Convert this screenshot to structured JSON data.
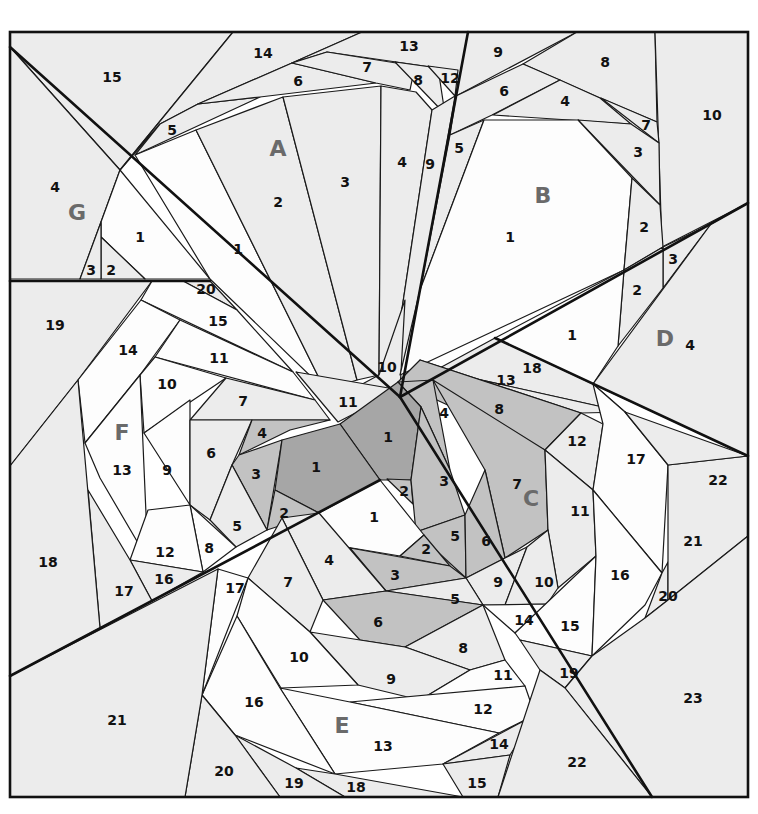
{
  "diagram": {
    "frame": {
      "x": 10,
      "y": 32,
      "width": 738,
      "height": 765
    },
    "colors": {
      "white": "#fdfdfd",
      "light": "#ececec",
      "mid": "#dcdcdc",
      "medium": "#c2c2c2",
      "dark": "#a6a6a6",
      "line": "#111111",
      "section_label": "#6a6a6a"
    },
    "sections": [
      {
        "id": "A",
        "label": "A",
        "x": 278,
        "y": 148
      },
      {
        "id": "B",
        "label": "B",
        "x": 543,
        "y": 195
      },
      {
        "id": "C",
        "label": "C",
        "x": 531,
        "y": 498
      },
      {
        "id": "D",
        "label": "D",
        "x": 665,
        "y": 338
      },
      {
        "id": "E",
        "label": "E",
        "x": 342,
        "y": 725
      },
      {
        "id": "F",
        "label": "F",
        "x": 122,
        "y": 432
      },
      {
        "id": "G",
        "label": "G",
        "x": 77,
        "y": 212
      }
    ],
    "pieces": [
      {
        "section": "G",
        "n": "15",
        "x": 112,
        "y": 77,
        "fill": "light",
        "points": "10,32 233,32 120,170 10,47"
      },
      {
        "section": "G",
        "n": "4",
        "x": 55,
        "y": 187,
        "fill": "light",
        "points": "10,47 120,170 101,222 80,279 10,279"
      },
      {
        "section": "G",
        "n": "1",
        "x": 140,
        "y": 237,
        "fill": "white",
        "points": "120,170 210,279 145,279 101,237 101,222"
      },
      {
        "section": "G",
        "n": "2",
        "x": 111,
        "y": 270,
        "fill": "light",
        "points": "101,237 145,279 101,279"
      },
      {
        "section": "G",
        "n": "3",
        "x": 91,
        "y": 270,
        "fill": "light",
        "points": "101,222 101,279 80,279"
      },
      {
        "section": "A",
        "n": "14",
        "x": 263,
        "y": 53,
        "fill": "light",
        "points": "233,32 362,32 292,63 198,104 160,124 120,170"
      },
      {
        "section": "A",
        "n": "13",
        "x": 409,
        "y": 46,
        "fill": "light",
        "points": "362,32 468,32 458,98 438,68 327,52 292,63"
      },
      {
        "section": "A",
        "n": "5",
        "x": 172,
        "y": 130,
        "fill": "light",
        "points": "160,124 198,104 260,97 135,155"
      },
      {
        "section": "A",
        "n": "6",
        "x": 298,
        "y": 81,
        "fill": "light",
        "points": "198,104 292,63 376,83 260,97"
      },
      {
        "section": "A",
        "n": "7",
        "x": 367,
        "y": 67,
        "fill": "light",
        "points": "292,63 327,52 415,66 410,90 376,83"
      },
      {
        "section": "A",
        "n": "8",
        "x": 418,
        "y": 80,
        "fill": "light",
        "points": "395,62 438,68 445,114"
      },
      {
        "section": "A",
        "n": "12",
        "x": 450,
        "y": 78,
        "fill": "light",
        "points": "428,66 458,70 455,96"
      },
      {
        "section": "A",
        "n": "1",
        "x": 238,
        "y": 249,
        "fill": "white",
        "points": "135,155 196,130 325,390 210,279"
      },
      {
        "section": "A",
        "n": "2",
        "x": 278,
        "y": 202,
        "fill": "light",
        "points": "196,130 283,97 357,380 325,390"
      },
      {
        "section": "A",
        "n": "3",
        "x": 345,
        "y": 182,
        "fill": "light",
        "points": "283,97 381,86 379,375 357,380"
      },
      {
        "section": "A",
        "n": "4",
        "x": 402,
        "y": 162,
        "fill": "light",
        "points": "381,86 416,92 432,110 392,375 379,375"
      },
      {
        "section": "A",
        "n": "9",
        "x": 430,
        "y": 164,
        "fill": "light",
        "points": "432,110 455,96 405,385 392,375"
      },
      {
        "section": "A",
        "n": "10",
        "x": 387,
        "y": 367,
        "fill": "light",
        "points": "379,375 405,300 400,390 355,388"
      },
      {
        "section": "A",
        "n": "11",
        "x": 348,
        "y": 402,
        "fill": "light",
        "points": "296,372 400,390 338,422"
      },
      {
        "section": "B",
        "n": "9",
        "x": 498,
        "y": 52,
        "fill": "light",
        "points": "468,32 577,32 456,96"
      },
      {
        "section": "B",
        "n": "8",
        "x": 605,
        "y": 62,
        "fill": "light",
        "points": "577,32 655,32 657,122 600,98 523,64"
      },
      {
        "section": "B",
        "n": "10",
        "x": 712,
        "y": 115,
        "fill": "light",
        "points": "655,32 748,32 748,203 662,247"
      },
      {
        "section": "B",
        "n": "6",
        "x": 504,
        "y": 91,
        "fill": "light",
        "points": "523,64 560,80 492,115 450,135 456,96"
      },
      {
        "section": "B",
        "n": "4",
        "x": 565,
        "y": 101,
        "fill": "light",
        "points": "560,80 600,98 631,124 493,115"
      },
      {
        "section": "B",
        "n": "7",
        "x": 646,
        "y": 125,
        "fill": "light",
        "points": "601,98 657,122 659,143"
      },
      {
        "section": "B",
        "n": "3",
        "x": 638,
        "y": 152,
        "fill": "light",
        "points": "578,120 631,124 659,143 660,205"
      },
      {
        "section": "B",
        "n": "5",
        "x": 459,
        "y": 148,
        "fill": "light",
        "points": "450,135 484,120 420,290"
      },
      {
        "section": "B",
        "n": "1",
        "x": 510,
        "y": 237,
        "fill": "white",
        "points": "484,120 578,120 632,178 624,270 400,375 420,290"
      },
      {
        "section": "B",
        "n": "2",
        "x": 644,
        "y": 227,
        "fill": "light",
        "points": "632,178 660,205 663,247 624,270"
      },
      {
        "section": "D",
        "n": "3",
        "x": 673,
        "y": 259,
        "fill": "light",
        "points": "663,247 711,224 663,288"
      },
      {
        "section": "D",
        "n": "2",
        "x": 637,
        "y": 290,
        "fill": "light",
        "points": "624,270 663,247 663,288 618,346"
      },
      {
        "section": "D",
        "n": "1",
        "x": 572,
        "y": 335,
        "fill": "white",
        "points": "495,338 624,270 618,346 593,384"
      },
      {
        "section": "D",
        "n": "4",
        "x": 690,
        "y": 345,
        "fill": "light",
        "points": "748,203 748,456 593,384 711,224"
      },
      {
        "section": "C",
        "n": "18",
        "x": 532,
        "y": 368,
        "fill": "light",
        "points": "436,370 495,338 593,384 625,412"
      },
      {
        "section": "C",
        "n": "13",
        "x": 506,
        "y": 380,
        "fill": "light",
        "points": "420,360 436,370 625,412 581,413"
      },
      {
        "section": "C",
        "n": "8",
        "x": 499,
        "y": 409,
        "fill": "medium",
        "points": "398,382 420,360 581,413 545,450"
      },
      {
        "section": "C",
        "n": "4",
        "x": 444,
        "y": 413,
        "fill": "medium",
        "points": "398,382 433,380 450,470 421,407"
      },
      {
        "section": "C",
        "n": "1",
        "x": 388,
        "y": 437,
        "fill": "dark",
        "points": "340,424 398,382 421,407 411,480 380,480"
      },
      {
        "section": "C",
        "n": "2",
        "x": 404,
        "y": 491,
        "fill": "medium",
        "points": "387,479 411,480 413,504"
      },
      {
        "section": "C",
        "n": "3",
        "x": 444,
        "y": 481,
        "fill": "medium",
        "points": "421,407 450,470 465,515 416,532 411,480"
      },
      {
        "section": "C",
        "n": "7",
        "x": 517,
        "y": 484,
        "fill": "medium",
        "points": "433,380 545,450 548,530 505,558 485,470"
      },
      {
        "section": "C",
        "n": "5",
        "x": 455,
        "y": 536,
        "fill": "medium",
        "points": "416,532 465,515 466,578"
      },
      {
        "section": "C",
        "n": "6",
        "x": 486,
        "y": 541,
        "fill": "medium",
        "points": "465,515 485,470 505,558 466,578"
      },
      {
        "section": "C",
        "n": "12",
        "x": 577,
        "y": 441,
        "fill": "light",
        "points": "545,450 581,413 603,424 593,490"
      },
      {
        "section": "C",
        "n": "11",
        "x": 580,
        "y": 511,
        "fill": "light",
        "points": "548,530 545,450 593,490 596,556 558,588"
      },
      {
        "section": "C",
        "n": "9",
        "x": 498,
        "y": 582,
        "fill": "light",
        "points": "466,578 505,558 527,547 505,605 483,605"
      },
      {
        "section": "C",
        "n": "10",
        "x": 544,
        "y": 582,
        "fill": "light",
        "points": "527,547 548,530 558,588 547,604 505,605"
      },
      {
        "section": "C",
        "n": "17",
        "x": 636,
        "y": 459,
        "fill": "white",
        "points": "593,384 625,412 668,465 662,573 593,490 603,424"
      },
      {
        "section": "C",
        "n": "14",
        "x": 524,
        "y": 620,
        "fill": "white",
        "points": "483,605 547,604 515,633"
      },
      {
        "section": "C",
        "n": "15",
        "x": 570,
        "y": 626,
        "fill": "white",
        "points": "515,633 596,556 592,656 520,640"
      },
      {
        "section": "C",
        "n": "16",
        "x": 620,
        "y": 575,
        "fill": "white",
        "points": "596,556 593,490 662,573 645,605 592,656"
      },
      {
        "section": "C",
        "n": "20",
        "x": 668,
        "y": 596,
        "fill": "light",
        "points": "662,573 668,562 668,600 645,618"
      },
      {
        "section": "C",
        "n": "21",
        "x": 693,
        "y": 541,
        "fill": "light",
        "points": "668,465 748,456 748,536 668,600"
      },
      {
        "section": "C",
        "n": "22",
        "x": 718,
        "y": 480,
        "fill": "light",
        "points": "625,412 748,456 668,465"
      },
      {
        "section": "C",
        "n": "19",
        "x": 569,
        "y": 673,
        "fill": "light",
        "points": "520,640 592,656 565,688 540,670"
      },
      {
        "section": "C",
        "n": "23",
        "x": 693,
        "y": 698,
        "fill": "light",
        "points": "748,536 748,797 652,797 565,688 592,656 645,618 668,600"
      },
      {
        "section": "F",
        "n": "19",
        "x": 55,
        "y": 325,
        "fill": "light",
        "points": "10,281 152,281 78,380 10,466"
      },
      {
        "section": "F",
        "n": "20",
        "x": 206,
        "y": 289,
        "fill": "light",
        "points": "183,281 210,281 237,310"
      },
      {
        "section": "F",
        "n": "15",
        "x": 218,
        "y": 321,
        "fill": "white",
        "points": "152,281 183,281 237,310 293,372 141,300"
      },
      {
        "section": "F",
        "n": "14",
        "x": 128,
        "y": 350,
        "fill": "white",
        "points": "141,300 180,320 140,375 85,443 78,380"
      },
      {
        "section": "F",
        "n": "11",
        "x": 219,
        "y": 358,
        "fill": "white",
        "points": "180,320 293,372 315,400 155,357"
      },
      {
        "section": "F",
        "n": "10",
        "x": 167,
        "y": 384,
        "fill": "white",
        "points": "155,357 226,378 144,433 140,375"
      },
      {
        "section": "F",
        "n": "7",
        "x": 243,
        "y": 401,
        "fill": "light",
        "points": "226,378 315,400 330,420 190,420"
      },
      {
        "section": "F",
        "n": "13",
        "x": 122,
        "y": 470,
        "fill": "white",
        "points": "85,443 140,375 148,560 100,478"
      },
      {
        "section": "F",
        "n": "9",
        "x": 167,
        "y": 470,
        "fill": "white",
        "points": "144,433 190,400 190,505"
      },
      {
        "section": "F",
        "n": "6",
        "x": 211,
        "y": 453,
        "fill": "light",
        "points": "190,420 252,420 232,465 210,520 190,505"
      },
      {
        "section": "F",
        "n": "4",
        "x": 262,
        "y": 433,
        "fill": "medium",
        "points": "252,420 330,420 290,430 239,455"
      },
      {
        "section": "F",
        "n": "3",
        "x": 256,
        "y": 474,
        "fill": "medium",
        "points": "239,455 282,440 267,530 232,465"
      },
      {
        "section": "F",
        "n": "1",
        "x": 316,
        "y": 467,
        "fill": "dark",
        "points": "282,440 340,424 380,480 319,513 275,490"
      },
      {
        "section": "F",
        "n": "2",
        "x": 284,
        "y": 513,
        "fill": "medium",
        "points": "275,490 319,513 267,530"
      },
      {
        "section": "F",
        "n": "5",
        "x": 237,
        "y": 526,
        "fill": "light",
        "points": "232,465 267,530 236,547 210,520"
      },
      {
        "section": "F",
        "n": "8",
        "x": 209,
        "y": 548,
        "fill": "white",
        "points": "190,505 236,547 203,572"
      },
      {
        "section": "F",
        "n": "12",
        "x": 165,
        "y": 552,
        "fill": "white",
        "points": "148,510 190,505 203,572 130,560"
      },
      {
        "section": "F",
        "n": "16",
        "x": 164,
        "y": 579,
        "fill": "light",
        "points": "130,560 203,572 152,601"
      },
      {
        "section": "F",
        "n": "17",
        "x": 124,
        "y": 591,
        "fill": "light",
        "points": "88,490 130,560 152,601 100,628"
      },
      {
        "section": "F",
        "n": "18",
        "x": 48,
        "y": 562,
        "fill": "light",
        "points": "10,466 78,380 100,628 10,676"
      },
      {
        "section": "E",
        "n": "1",
        "x": 374,
        "y": 517,
        "fill": "white",
        "points": "319,513 380,480 424,535 400,556 340,546"
      },
      {
        "section": "E",
        "n": "2",
        "x": 426,
        "y": 549,
        "fill": "medium",
        "points": "400,556 424,535 450,566"
      },
      {
        "section": "E",
        "n": "3",
        "x": 395,
        "y": 575,
        "fill": "medium",
        "points": "350,548 450,566 466,578 386,591"
      },
      {
        "section": "E",
        "n": "4",
        "x": 329,
        "y": 560,
        "fill": "light",
        "points": "282,518 319,513 386,591 323,600"
      },
      {
        "section": "E",
        "n": "5",
        "x": 455,
        "y": 599,
        "fill": "light",
        "points": "386,591 466,578 483,605 420,596"
      },
      {
        "section": "E",
        "n": "6",
        "x": 378,
        "y": 622,
        "fill": "medium",
        "points": "323,600 386,591 483,605 405,647 360,640"
      },
      {
        "section": "E",
        "n": "7",
        "x": 288,
        "y": 582,
        "fill": "light",
        "points": "248,578 282,518 323,600 310,632"
      },
      {
        "section": "E",
        "n": "8",
        "x": 463,
        "y": 648,
        "fill": "light",
        "points": "405,647 483,605 505,660 470,670"
      },
      {
        "section": "E",
        "n": "9",
        "x": 391,
        "y": 679,
        "fill": "light",
        "points": "310,632 360,640 405,647 470,670 420,700 358,685"
      },
      {
        "section": "E",
        "n": "10",
        "x": 299,
        "y": 657,
        "fill": "white",
        "points": "237,616 248,578 310,632 358,685 281,688"
      },
      {
        "section": "E",
        "n": "11",
        "x": 503,
        "y": 675,
        "fill": "white",
        "points": "470,670 505,660 525,686 420,700"
      },
      {
        "section": "E",
        "n": "12",
        "x": 483,
        "y": 709,
        "fill": "white",
        "points": "350,702 525,686 535,715 499,733"
      },
      {
        "section": "E",
        "n": "13",
        "x": 383,
        "y": 746,
        "fill": "white",
        "points": "280,688 350,702 499,733 443,764 335,774"
      },
      {
        "section": "E",
        "n": "14",
        "x": 499,
        "y": 744,
        "fill": "light",
        "points": "443,764 535,715 510,755"
      },
      {
        "section": "E",
        "n": "15",
        "x": 477,
        "y": 783,
        "fill": "light",
        "points": "443,764 510,755 498,797 463,797"
      },
      {
        "section": "E",
        "n": "16",
        "x": 254,
        "y": 702,
        "fill": "white",
        "points": "237,616 280,688 335,774 235,735 202,695"
      },
      {
        "section": "E",
        "n": "17",
        "x": 235,
        "y": 588,
        "fill": "white",
        "points": "218,569 248,578 202,695"
      },
      {
        "section": "E",
        "n": "18",
        "x": 356,
        "y": 787,
        "fill": "light",
        "points": "296,768 335,774 463,797 345,797"
      },
      {
        "section": "E",
        "n": "19",
        "x": 294,
        "y": 783,
        "fill": "light",
        "points": "235,735 296,768 345,797 280,797"
      },
      {
        "section": "E",
        "n": "20",
        "x": 224,
        "y": 771,
        "fill": "light",
        "points": "202,695 235,735 280,797 185,797"
      },
      {
        "section": "E",
        "n": "21",
        "x": 117,
        "y": 720,
        "fill": "light",
        "points": "10,676 218,569 202,695 185,797 10,797"
      },
      {
        "section": "E",
        "n": "22",
        "x": 577,
        "y": 762,
        "fill": "light",
        "points": "540,670 565,688 652,797 498,797"
      }
    ],
    "seams": [
      "10,47 400,397",
      "10,281 210,281",
      "468,32 400,397",
      "400,397 748,203",
      "495,338 748,456",
      "400,397 652,797",
      "10,676 380,480"
    ]
  }
}
